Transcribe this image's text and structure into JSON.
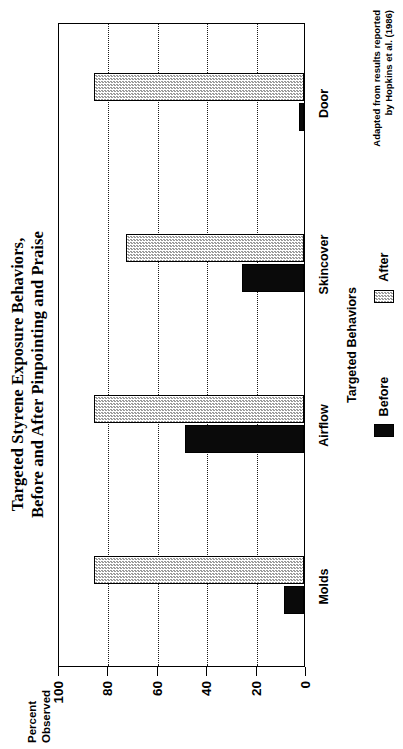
{
  "chart_data": {
    "type": "bar",
    "title": "Targeted Styrene Exposure Behaviors, Before and After Pinpointing and Praise",
    "title_lines": [
      "Targeted Styrene Exposure Behaviors,",
      "Before and After Pinpointing and Praise"
    ],
    "xlabel": "Targeted Behaviors",
    "ylabel": "Percent Observed",
    "ylabel_lines": [
      "Percent",
      "Observed"
    ],
    "categories": [
      "Molds",
      "Airflow",
      "Skincover",
      "Door"
    ],
    "ylim": [
      0,
      100
    ],
    "yticks": [
      0,
      20,
      40,
      60,
      80,
      100
    ],
    "ytick_labels": [
      "0",
      "20",
      "40",
      "60",
      "80",
      "100"
    ],
    "grid": true,
    "legend_position": "bottom",
    "series": [
      {
        "name": "Before",
        "color": "#0a0a0a",
        "values": [
          8,
          48,
          25,
          2
        ]
      },
      {
        "name": "After",
        "color": "#c9c9c9",
        "values": [
          85,
          85,
          72,
          85
        ]
      }
    ],
    "annotations": [
      "Adapted from results reported",
      "by Hopkins et al. (1986)"
    ],
    "source_note": "Adapted from results reported by Hopkins et al. (1986)"
  },
  "legend": {
    "items": [
      {
        "label": "Before"
      },
      {
        "label": "After"
      }
    ]
  },
  "source": {
    "line1": "Adapted from results reported",
    "line2": "by Hopkins et al. (1986)"
  }
}
